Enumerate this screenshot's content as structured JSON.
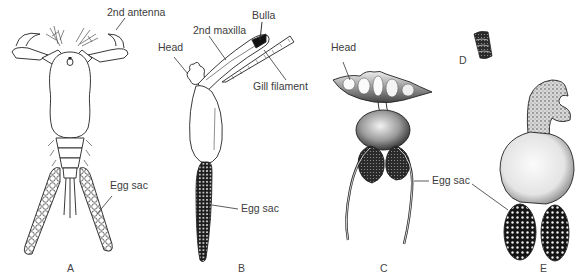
{
  "figure": {
    "panels": [
      {
        "id": "A",
        "letter": "A",
        "labels": {
          "antenna": "2nd antenna",
          "egg_sac": "Egg sac"
        }
      },
      {
        "id": "B",
        "letter": "B",
        "labels": {
          "head": "Head",
          "maxilla": "2nd maxilla",
          "bulla": "Bulla",
          "gill": "Gill filament",
          "egg_sac": "Egg sac"
        }
      },
      {
        "id": "C",
        "letter": "C",
        "labels": {
          "head": "Head",
          "egg_sac": "Egg sac"
        }
      },
      {
        "id": "D",
        "letter": "D"
      },
      {
        "id": "E",
        "letter": "E"
      }
    ]
  },
  "colors": {
    "ink": "#1a1a1a",
    "text": "#3c3c3c",
    "background": "#ffffff"
  }
}
